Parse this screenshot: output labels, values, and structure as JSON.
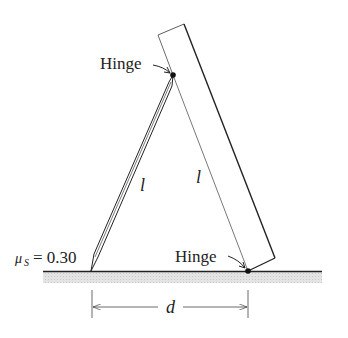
{
  "diagram": {
    "labels": {
      "hinge_top": "Hinge",
      "hinge_bottom": "Hinge",
      "rod_length": "l",
      "plank_length": "l",
      "friction_symbol": "μ",
      "friction_subscript": "S",
      "friction_value": "= 0.30",
      "distance": "d"
    },
    "colors": {
      "line": "#222222",
      "ground_shade": "#d8d8d8",
      "background": "#ffffff"
    }
  }
}
